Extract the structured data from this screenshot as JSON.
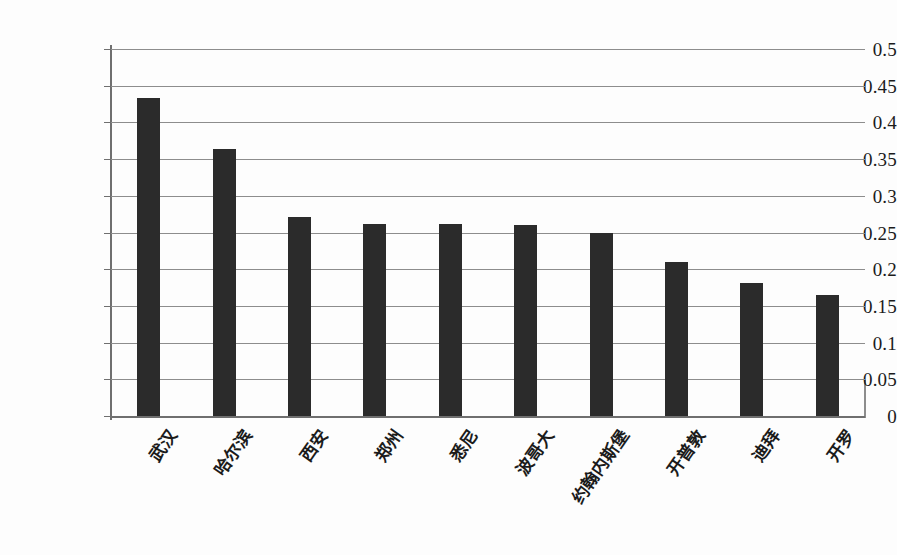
{
  "chart_data": {
    "type": "bar",
    "title": "",
    "xlabel": "",
    "ylabel": "",
    "categories": [
      "武汉",
      "哈尔滨",
      "西安",
      "郑州",
      "悉尼",
      "波哥大",
      "约翰内斯堡",
      "开普敦",
      "迪拜",
      "开罗"
    ],
    "values": [
      0.433,
      0.364,
      0.271,
      0.262,
      0.262,
      0.26,
      0.249,
      0.21,
      0.181,
      0.165
    ],
    "ylim": [
      0,
      0.5
    ],
    "ytick_labels": [
      "0.5",
      "0.45",
      "0.4",
      "0.35",
      "0.3",
      "0.25",
      "0.2",
      "0.15",
      "0.1",
      "0.05",
      "0"
    ],
    "ytick_values": [
      0.5,
      0.45,
      0.4,
      0.35,
      0.3,
      0.25,
      0.2,
      0.15,
      0.1,
      0.05,
      0
    ],
    "grid": true,
    "legend": "none",
    "series": [
      {
        "name": "",
        "values": [
          0.433,
          0.364,
          0.271,
          0.262,
          0.262,
          0.26,
          0.249,
          0.21,
          0.181,
          0.165
        ]
      }
    ],
    "colors": {
      "bar": "#2b2b2b",
      "gridline": "#8d8d8d",
      "axis": "#6f6f6f",
      "text": "#1b1b1b",
      "background": "#fdfdfd"
    }
  }
}
